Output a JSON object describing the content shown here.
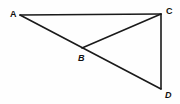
{
  "figure": {
    "canvas": {
      "width": 180,
      "height": 104,
      "background": "#fefefe"
    },
    "stroke_color": "#1a1a1a",
    "label_color": "#101010",
    "points": [
      {
        "id": "A",
        "label": "A",
        "x": 20,
        "y": 15,
        "label_x": 10,
        "label_y": 10
      },
      {
        "id": "B",
        "label": "B",
        "x": 82,
        "y": 48,
        "label_x": 78,
        "label_y": 54
      },
      {
        "id": "C",
        "label": "C",
        "x": 161,
        "y": 14,
        "label_x": 166,
        "label_y": 7
      },
      {
        "id": "D",
        "label": "D",
        "x": 161,
        "y": 89,
        "label_x": 165,
        "label_y": 91
      }
    ],
    "segments": [
      {
        "id": "AC",
        "from": "A",
        "to": "C",
        "x1": 20,
        "y1": 15,
        "x2": 161,
        "y2": 14
      },
      {
        "id": "AD",
        "from": "A",
        "to": "D",
        "x1": 20,
        "y1": 15,
        "x2": 161,
        "y2": 89
      },
      {
        "id": "BC",
        "from": "B",
        "to": "C",
        "x1": 82,
        "y1": 48,
        "x2": 161,
        "y2": 14
      },
      {
        "id": "CD",
        "from": "C",
        "to": "D",
        "x1": 161,
        "y1": 14,
        "x2": 161,
        "y2": 89
      }
    ]
  }
}
